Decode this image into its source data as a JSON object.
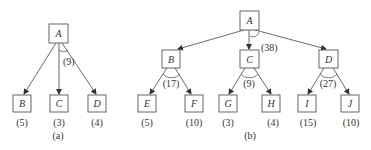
{
  "figure_a": {
    "caption": "(a)",
    "root": {
      "label": "A",
      "and_arc_cost": "(9)"
    },
    "children": [
      {
        "label": "B",
        "cost": "(5)"
      },
      {
        "label": "C",
        "cost": "(3)"
      },
      {
        "label": "D",
        "cost": "(4)"
      }
    ]
  },
  "figure_b": {
    "caption": "(b)",
    "root": {
      "label": "A",
      "arc_cost": "(38)"
    },
    "level1": [
      {
        "label": "B",
        "and_arc_cost": "(17)",
        "children": [
          {
            "label": "E",
            "cost": "(5)"
          },
          {
            "label": "F",
            "cost": "(10)"
          }
        ]
      },
      {
        "label": "C",
        "and_arc_cost": "(9)",
        "children": [
          {
            "label": "G",
            "cost": "(3)"
          },
          {
            "label": "H",
            "cost": "(4)"
          }
        ]
      },
      {
        "label": "D",
        "and_arc_cost": "(27)",
        "children": [
          {
            "label": "I",
            "cost": "(15)"
          },
          {
            "label": "J",
            "cost": "(10)"
          }
        ]
      }
    ]
  }
}
